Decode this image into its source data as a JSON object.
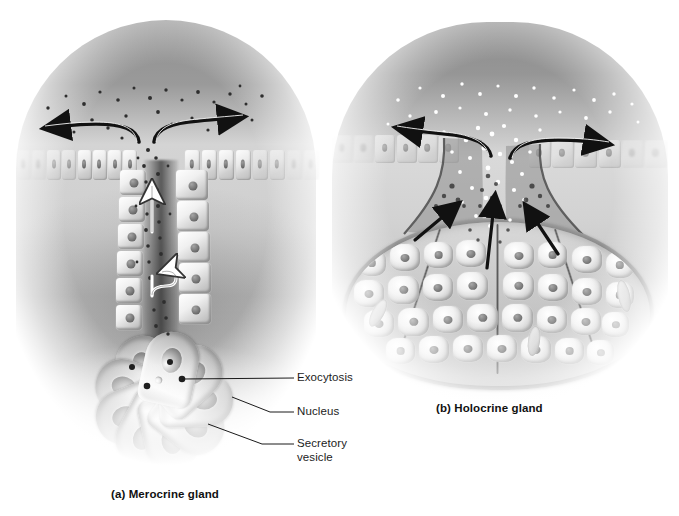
{
  "figure": {
    "type": "biological-diagram",
    "background_color": "#ffffff",
    "ink_color": "#1a1a1a"
  },
  "panels": [
    {
      "id": "merocrine",
      "caption": "(a) Merocrine gland",
      "duct_label": "duct",
      "structures": {
        "epithelium": "surface epithelium",
        "duct": "gland duct",
        "acinus": "secretory acinus"
      },
      "arrows": [
        {
          "name": "secretion-outflow-left",
          "style": "curved-black"
        },
        {
          "name": "secretion-outflow-right",
          "style": "curved-black"
        },
        {
          "name": "secretion-up-duct-upper",
          "style": "straight-white"
        },
        {
          "name": "secretion-up-duct-lower",
          "style": "straight-white"
        }
      ],
      "callouts": [
        {
          "id": "exocytosis",
          "text": "Exocytosis"
        },
        {
          "id": "nucleus",
          "text": "Nucleus"
        },
        {
          "id": "secretory-vesicle",
          "text": "Secretory\nvesicle",
          "line1": "Secretory",
          "line2": "vesicle"
        }
      ]
    },
    {
      "id": "holocrine",
      "caption": "(b) Holocrine gland",
      "structures": {
        "epithelium": "surface epithelium",
        "duct": "gland duct",
        "sac": "holocrine secretory sac"
      },
      "arrows": [
        {
          "name": "secretion-outflow-left",
          "style": "curved-black"
        },
        {
          "name": "secretion-outflow-right",
          "style": "curved-black"
        },
        {
          "name": "cell-breakdown-left",
          "style": "straight-black"
        },
        {
          "name": "cell-breakdown-center",
          "style": "straight-black"
        },
        {
          "name": "cell-breakdown-right",
          "style": "straight-black"
        }
      ]
    }
  ]
}
